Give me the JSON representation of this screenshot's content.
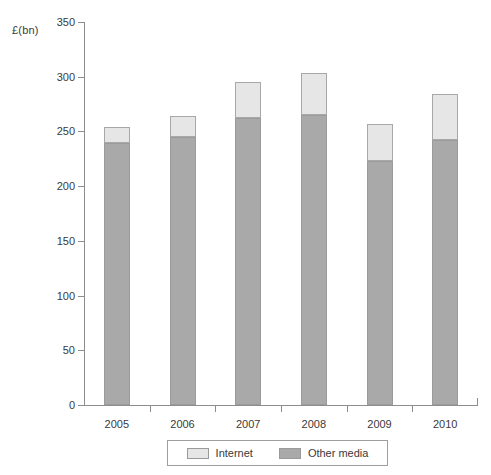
{
  "chart_data": {
    "type": "bar",
    "title": "",
    "subtitle": "",
    "xlabel": "",
    "ylabel": "£(bn)",
    "categories": [
      "2005",
      "2006",
      "2007",
      "2008",
      "2009",
      "2010"
    ],
    "series": [
      {
        "name": "Other media",
        "color": "#a9a9a9",
        "values": [
          239,
          245,
          262,
          265,
          223,
          242
        ]
      },
      {
        "name": "Internet",
        "color": "#e6e6e6",
        "values": [
          15,
          19,
          33,
          38,
          34,
          42
        ]
      }
    ],
    "totals": [
      254,
      264,
      295,
      303,
      257,
      284
    ],
    "stacked": true,
    "stack_order": [
      "Other media",
      "Internet"
    ],
    "ylim": [
      0,
      350
    ],
    "yticks": [
      0,
      50,
      100,
      150,
      200,
      250,
      300,
      350
    ],
    "ytick_labels": [
      "0",
      "50",
      "100",
      "150",
      "200",
      "250",
      "300",
      "350"
    ],
    "grid": false,
    "legend_position": "bottom",
    "legend_entries": [
      "Internet",
      "Other media"
    ]
  },
  "axis": {
    "y_title": "£(bn)"
  },
  "legend": {
    "items": [
      {
        "label": "Internet",
        "swatch_class": "internet"
      },
      {
        "label": "Other media",
        "swatch_class": "other"
      }
    ]
  }
}
